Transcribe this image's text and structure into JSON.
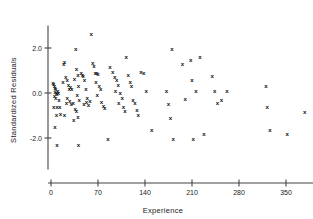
{
  "chart_data": {
    "type": "scatter",
    "title": "",
    "xlabel": "Experience",
    "ylabel": "Standardized  Residuals",
    "xlim": [
      -8,
      400
    ],
    "ylim": [
      -3.4,
      3.0
    ],
    "xticks": [
      0,
      70,
      140,
      210,
      280,
      350
    ],
    "xticklabels": [
      "0",
      "70",
      "140",
      "210",
      "280",
      "350"
    ],
    "yticks": [
      2.0,
      0.0,
      -2.0
    ],
    "yticklabels": [
      "2.0",
      "0.0",
      "-2.0"
    ],
    "grid": false,
    "legend": null,
    "marker": "x",
    "marker_color": "#111111",
    "axis_color": "#444444",
    "background": "#ffffff",
    "points": [
      [
        3,
        0.45
      ],
      [
        4,
        0.4
      ],
      [
        5,
        0.3
      ],
      [
        6,
        0.22
      ],
      [
        7,
        0.18
      ],
      [
        6,
        0.05
      ],
      [
        8,
        0.02
      ],
      [
        9,
        -0.05
      ],
      [
        5,
        -0.12
      ],
      [
        7,
        -0.2
      ],
      [
        10,
        0.12
      ],
      [
        11,
        0.0
      ],
      [
        12,
        -0.3
      ],
      [
        4,
        -0.62
      ],
      [
        9,
        -0.6
      ],
      [
        13,
        -0.6
      ],
      [
        8,
        -0.95
      ],
      [
        14,
        -0.92
      ],
      [
        20,
        -0.98
      ],
      [
        6,
        -1.52
      ],
      [
        9,
        -2.3
      ],
      [
        18,
        0.52
      ],
      [
        19,
        1.28
      ],
      [
        20,
        1.4
      ],
      [
        22,
        0.7
      ],
      [
        24,
        0.58
      ],
      [
        26,
        0.35
      ],
      [
        27,
        0.2
      ],
      [
        29,
        0.28
      ],
      [
        31,
        0.18
      ],
      [
        24,
        -0.22
      ],
      [
        28,
        -0.35
      ],
      [
        23,
        -0.45
      ],
      [
        30,
        -0.5
      ],
      [
        33,
        -0.42
      ],
      [
        35,
        0.62
      ],
      [
        37,
        1.95
      ],
      [
        38,
        1.08
      ],
      [
        40,
        0.8
      ],
      [
        41,
        0.3
      ],
      [
        39,
        -0.08
      ],
      [
        42,
        -0.3
      ],
      [
        36,
        -0.68
      ],
      [
        38,
        -0.8
      ],
      [
        40,
        -1.05
      ],
      [
        34,
        -1.18
      ],
      [
        41,
        -2.32
      ],
      [
        45,
        0.88
      ],
      [
        47,
        0.82
      ],
      [
        48,
        0.78
      ],
      [
        50,
        0.6
      ],
      [
        52,
        0.2
      ],
      [
        54,
        -0.2
      ],
      [
        49,
        -0.48
      ],
      [
        53,
        -0.4
      ],
      [
        56,
        -0.52
      ],
      [
        58,
        -0.35
      ],
      [
        60,
        2.62
      ],
      [
        62,
        1.36
      ],
      [
        64,
        1.22
      ],
      [
        66,
        0.88
      ],
      [
        68,
        0.92
      ],
      [
        70,
        0.85
      ],
      [
        67,
        0.52
      ],
      [
        72,
        0.3
      ],
      [
        74,
        0.18
      ],
      [
        69,
        -0.1
      ],
      [
        75,
        -0.38
      ],
      [
        78,
        -0.58
      ],
      [
        80,
        -0.65
      ],
      [
        85,
        -2.02
      ],
      [
        88,
        1.18
      ],
      [
        92,
        0.95
      ],
      [
        95,
        0.72
      ],
      [
        98,
        0.58
      ],
      [
        100,
        0.38
      ],
      [
        96,
        0.12
      ],
      [
        103,
        0.0
      ],
      [
        106,
        -0.22
      ],
      [
        101,
        -0.42
      ],
      [
        108,
        -0.62
      ],
      [
        110,
        -0.78
      ],
      [
        112,
        1.62
      ],
      [
        115,
        0.82
      ],
      [
        118,
        0.52
      ],
      [
        120,
        0.3
      ],
      [
        122,
        -0.3
      ],
      [
        125,
        -0.42
      ],
      [
        128,
        -0.75
      ],
      [
        130,
        -0.98
      ],
      [
        134,
        0.95
      ],
      [
        138,
        0.9
      ],
      [
        142,
        0.08
      ],
      [
        150,
        -1.62
      ],
      [
        172,
        0.12
      ],
      [
        175,
        -0.48
      ],
      [
        178,
        -1.1
      ],
      [
        180,
        1.98
      ],
      [
        182,
        -2.05
      ],
      [
        196,
        1.28
      ],
      [
        200,
        -0.25
      ],
      [
        208,
        1.48
      ],
      [
        210,
        0.58
      ],
      [
        212,
        -2.02
      ],
      [
        216,
        0.12
      ],
      [
        222,
        1.6
      ],
      [
        228,
        -1.82
      ],
      [
        240,
        0.78
      ],
      [
        244,
        0.12
      ],
      [
        248,
        -0.45
      ],
      [
        254,
        -0.28
      ],
      [
        262,
        0.1
      ],
      [
        320,
        0.32
      ],
      [
        322,
        -0.62
      ],
      [
        326,
        -1.62
      ],
      [
        352,
        -1.82
      ],
      [
        378,
        -0.82
      ]
    ]
  }
}
